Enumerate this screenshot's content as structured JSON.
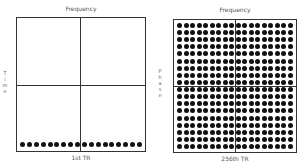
{
  "left_panel": {
    "top_label": "Frequency",
    "side_label": [
      "T",
      "i",
      "m",
      "e"
    ],
    "bottom_label": "1st TR",
    "dot_rows": 1,
    "dot_cols": 18
  },
  "right_panel": {
    "top_label": "Frequency",
    "side_label": [
      "P",
      "h",
      "a",
      "s",
      "e"
    ],
    "bottom_label": "256th TR",
    "dot_rows": 18,
    "dot_cols": 18
  }
}
